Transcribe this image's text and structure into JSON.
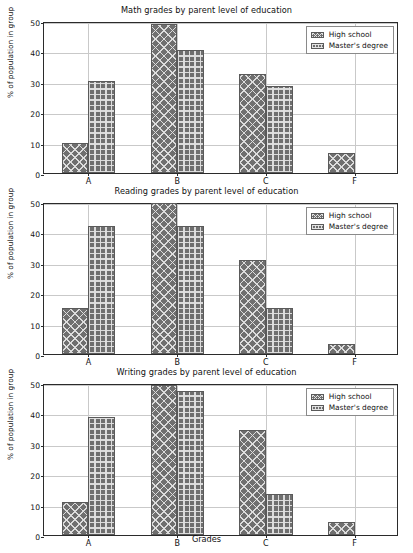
{
  "figure": {
    "xlabel": "Grades",
    "ylabel": "% of population in group",
    "legend": {
      "position": "upper right",
      "entries": [
        "High school",
        "Master's degree"
      ]
    },
    "ylim": [
      0,
      50
    ],
    "yticks": [
      "0",
      "10",
      "20",
      "30",
      "40",
      "50"
    ],
    "xticks": [
      "A",
      "B",
      "C",
      "F"
    ],
    "colors": {
      "bar_fill": "#6f6f6f",
      "bar_edge": "#5a5a5a",
      "grid": "#c9c9c9",
      "axis": "#2b2b2b",
      "text": "#111111",
      "background": "#ffffff"
    }
  },
  "chart_data": [
    {
      "type": "bar",
      "title": "Math grades by parent level of education",
      "xlabel": "",
      "ylabel": "% of population in group",
      "categories": [
        "A",
        "B",
        "C",
        "F"
      ],
      "ylim": [
        0,
        50
      ],
      "yticks": [
        0,
        10,
        20,
        30,
        40,
        50
      ],
      "grid": true,
      "legend": "upper right",
      "series": [
        {
          "name": "High school",
          "hatch": "xx",
          "values": [
            9.9,
            49.1,
            32.7,
            6.6
          ]
        },
        {
          "name": "Master's degree",
          "hatch": "++",
          "values": [
            30.2,
            40.4,
            28.5,
            0.0
          ]
        }
      ]
    },
    {
      "type": "bar",
      "title": "Reading grades by parent level of education",
      "xlabel": "",
      "ylabel": "% of population in group",
      "categories": [
        "A",
        "B",
        "C",
        "F"
      ],
      "ylim": [
        0,
        50
      ],
      "yticks": [
        0,
        10,
        20,
        30,
        40,
        50
      ],
      "grid": true,
      "legend": "upper right",
      "series": [
        {
          "name": "High school",
          "hatch": "xx",
          "values": [
            15.0,
            49.8,
            30.8,
            3.2
          ]
        },
        {
          "name": "Master's degree",
          "hatch": "++",
          "values": [
            42.0,
            42.0,
            15.0,
            0.0
          ]
        }
      ]
    },
    {
      "type": "bar",
      "title": "Writing grades by parent level of education",
      "xlabel": "Grades",
      "ylabel": "% of population in group",
      "categories": [
        "A",
        "B",
        "C",
        "F"
      ],
      "ylim": [
        0,
        50
      ],
      "yticks": [
        0,
        10,
        20,
        30,
        40,
        50
      ],
      "grid": true,
      "legend": "upper right",
      "series": [
        {
          "name": "High school",
          "hatch": "xx",
          "values": [
            11.0,
            49.4,
            34.4,
            4.3
          ]
        },
        {
          "name": "Master's degree",
          "hatch": "++",
          "values": [
            38.8,
            47.3,
            13.4,
            0.0
          ]
        }
      ]
    }
  ]
}
